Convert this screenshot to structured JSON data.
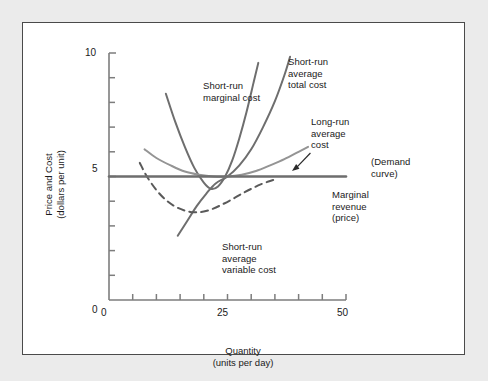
{
  "figure": {
    "background_color": "#ebebeb",
    "panel_color": "#ffffff",
    "border_color": "#4a4a4a"
  },
  "chart_data": {
    "type": "line",
    "title": "",
    "xlabel": "Quantity\n(units per day)",
    "xlabel_line1": "Quantity",
    "xlabel_line2": "(units per day)",
    "ylabel": "Price and Cost\n(dollars per unit)",
    "ylabel_line1": "Price and Cost",
    "ylabel_line2": "(dollars per unit)",
    "xlim": [
      0,
      50
    ],
    "ylim": [
      0,
      10
    ],
    "x_ticks": [
      0,
      5,
      10,
      15,
      20,
      25,
      30,
      35,
      40,
      45,
      50
    ],
    "x_tick_labels": [
      "0",
      "",
      "",
      "",
      "",
      "25",
      "",
      "",
      "",
      "",
      "50"
    ],
    "y_ticks": [
      0,
      1,
      2,
      3,
      4,
      5,
      6,
      7,
      8,
      9,
      10
    ],
    "y_tick_labels": [
      "0",
      "",
      "",
      "",
      "",
      "5",
      "",
      "",
      "",
      "",
      "10"
    ],
    "grid": false,
    "legend_position": "annotations-inline",
    "equilibrium_point": {
      "x": 25,
      "y": 5
    },
    "series": [
      {
        "name": "Short-run marginal cost",
        "short_name": "SRMC",
        "style": "solid",
        "color": "#6e6e6e",
        "width": 2.0,
        "points": [
          [
            12,
            8.35
          ],
          [
            14,
            7.2
          ],
          [
            16,
            6.2
          ],
          [
            18,
            5.35
          ],
          [
            20,
            4.75
          ],
          [
            21.5,
            4.5
          ],
          [
            23,
            4.6
          ],
          [
            24.5,
            5.0
          ],
          [
            26,
            5.65
          ],
          [
            27.5,
            6.55
          ],
          [
            29,
            7.6
          ],
          [
            30.5,
            8.8
          ],
          [
            31.5,
            9.6
          ]
        ]
      },
      {
        "name": "Short-run average total cost",
        "short_name": "SRATC",
        "style": "solid",
        "color": "#6e6e6e",
        "width": 2.0,
        "points": [
          [
            14.5,
            2.6
          ],
          [
            16.5,
            3.2
          ],
          [
            18.5,
            3.8
          ],
          [
            20.5,
            4.3
          ],
          [
            22.5,
            4.72
          ],
          [
            25,
            5.0
          ],
          [
            27.5,
            5.45
          ],
          [
            30,
            6.1
          ],
          [
            32.5,
            7.0
          ],
          [
            35,
            8.05
          ],
          [
            37,
            9.1
          ],
          [
            38.2,
            9.85
          ]
        ]
      },
      {
        "name": "Long-run average cost",
        "short_name": "LRAC",
        "style": "solid",
        "color": "#949494",
        "width": 2.0,
        "points": [
          [
            7.5,
            6.1
          ],
          [
            10,
            5.75
          ],
          [
            13,
            5.45
          ],
          [
            16,
            5.2
          ],
          [
            19,
            5.07
          ],
          [
            22,
            5.0
          ],
          [
            25,
            5.0
          ],
          [
            28,
            5.07
          ],
          [
            31,
            5.22
          ],
          [
            34,
            5.45
          ],
          [
            37,
            5.7
          ],
          [
            40,
            6.0
          ],
          [
            42,
            6.2
          ]
        ]
      },
      {
        "name": "Short-run average variable cost",
        "short_name": "SRAVC",
        "style": "dashed",
        "color": "#5a5a5a",
        "width": 2.0,
        "points": [
          [
            6.5,
            5.55
          ],
          [
            8,
            5.0
          ],
          [
            10,
            4.45
          ],
          [
            12,
            4.05
          ],
          [
            14,
            3.78
          ],
          [
            16,
            3.62
          ],
          [
            18,
            3.55
          ],
          [
            20,
            3.58
          ],
          [
            22,
            3.7
          ],
          [
            24,
            3.88
          ],
          [
            26,
            4.08
          ],
          [
            28,
            4.3
          ],
          [
            30,
            4.5
          ],
          [
            32,
            4.68
          ],
          [
            34,
            4.82
          ],
          [
            35.5,
            4.9
          ]
        ]
      },
      {
        "name": "Demand curve / Marginal revenue (price)",
        "short_name": "Demand = MR = Price",
        "style": "solid-horizontal",
        "color": "#6e6e6e",
        "width": 2.6,
        "value": 5,
        "points": [
          [
            0,
            5
          ],
          [
            50,
            5
          ]
        ]
      }
    ],
    "annotations": [
      {
        "id": "srmc-label",
        "text": "Short-run\nmarginal cost",
        "line1": "Short-run",
        "line2": "marginal cost",
        "x": 17,
        "y": 8.6
      },
      {
        "id": "sratc-label",
        "text": "Short-run\naverage\ntotal cost",
        "line1": "Short-run",
        "line2": "average",
        "line3": "total cost",
        "x": 30,
        "y": 9.5
      },
      {
        "id": "lrac-label",
        "text": "Long-run\naverage\ncost",
        "line1": "Long-run",
        "line2": "average",
        "line3": "cost",
        "x": 34,
        "y": 7.1
      },
      {
        "id": "demand-label",
        "text": "(Demand\ncurve)",
        "line1": "(Demand",
        "line2": "curve)",
        "x": 43,
        "y": 5.8,
        "has_arrow": true
      },
      {
        "id": "mr-label",
        "text": "Marginal\nrevenue\n(price)",
        "line1": "Marginal",
        "line2": "revenue",
        "line3": "(price)",
        "x": 39,
        "y": 4.4
      },
      {
        "id": "sravc-label",
        "text": "Short-run\naverage\nvariable cost",
        "line1": "Short-run",
        "line2": "average",
        "line3": "variable cost",
        "x": 24,
        "y": 2.9
      }
    ]
  },
  "axis": {
    "y_top_label": "10",
    "y_mid_label": "5",
    "y_zero_label": "0",
    "x_zero_label": "0",
    "x_mid_label": "25",
    "x_max_label": "50"
  },
  "annotations_text": {
    "srmc_l1": "Short-run",
    "srmc_l2": "marginal cost",
    "sratc_l1": "Short-run",
    "sratc_l2": "average",
    "sratc_l3": "total cost",
    "lrac_l1": "Long-run",
    "lrac_l2": "average",
    "lrac_l3": "cost",
    "demand_l1": "(Demand",
    "demand_l2": "curve)",
    "mr_l1": "Marginal",
    "mr_l2": "revenue",
    "mr_l3": "(price)",
    "sravc_l1": "Short-run",
    "sravc_l2": "average",
    "sravc_l3": "variable cost"
  },
  "axis_titles": {
    "y_l1": "Price and Cost",
    "y_l2": "(dollars per unit)",
    "x_l1": "Quantity",
    "x_l2": "(units per day)"
  }
}
